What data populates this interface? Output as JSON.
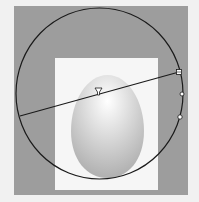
{
  "canvas": {
    "background_color": "#9d9d9d",
    "artboard_color": "#f6f6f6",
    "page_color": "#f1f1f1"
  },
  "shape": {
    "type": "egg-ellipse",
    "fill_light": "#ffffff",
    "fill_dark": "#b4b4b4"
  },
  "gradient_tool": {
    "type": "radial",
    "ring_color": "#1a1a1a",
    "line_start": [
      20,
      116
    ],
    "line_end": [
      179,
      72
    ],
    "midpoint_marker": "triangle",
    "handles": [
      "square-endpoint",
      "circle-handle",
      "circle-handle"
    ]
  }
}
